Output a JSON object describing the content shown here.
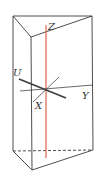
{
  "figure": {
    "type": "triangular-prism-with-axes",
    "colors": {
      "edge": "#3a3a3a",
      "z_axis": "#d9644f",
      "u_axis": "#3f3f3f",
      "thin_axis": "#444444",
      "label": "#333333"
    },
    "labels": {
      "z": "Z",
      "u": "U",
      "y": "Y",
      "x": "X"
    }
  }
}
